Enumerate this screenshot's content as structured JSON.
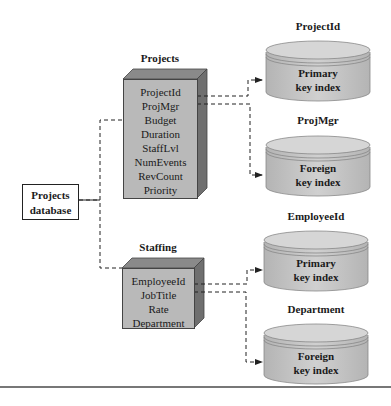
{
  "database": {
    "label_line1": "Projects",
    "label_line2": "database"
  },
  "tables": [
    {
      "title": "Projects",
      "fields": [
        "ProjectId",
        "ProjMgr",
        "Budget",
        "Duration",
        "StaffLvl",
        "NumEvents",
        "RevCount",
        "Priority"
      ]
    },
    {
      "title": "Staffing",
      "fields": [
        "EmployeeId",
        "JobTitle",
        "Rate",
        "Department"
      ]
    }
  ],
  "indexes": [
    {
      "title": "ProjectId",
      "line1": "Primary",
      "line2": "key index"
    },
    {
      "title": "ProjMgr",
      "line1": "Foreign",
      "line2": "key index"
    },
    {
      "title": "EmployeeId",
      "line1": "Primary",
      "line2": "key index"
    },
    {
      "title": "Department",
      "line1": "Foreign",
      "line2": "key index"
    }
  ],
  "colors": {
    "table_face": "#b9b9b9",
    "table_top": "#8a8a8a",
    "table_side": "#6f6f6f",
    "cylinder_body": "#c8c8c8",
    "cylinder_top": "#d6d6d6",
    "line": "#222222"
  }
}
